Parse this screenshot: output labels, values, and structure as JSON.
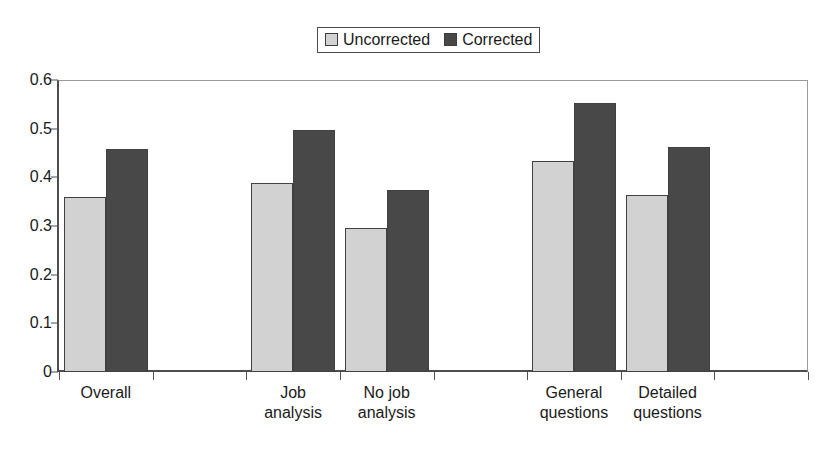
{
  "chart_data": {
    "type": "bar",
    "title": "",
    "subtitle": "",
    "xlabel": "",
    "ylabel": "",
    "ylim": [
      0,
      0.6
    ],
    "ytick_labels": [
      "0",
      "0.1",
      "0.2",
      "0.3",
      "0.4",
      "0.5",
      "0.6"
    ],
    "ytick_values": [
      0,
      0.1,
      0.2,
      0.3,
      0.4,
      0.5,
      0.6
    ],
    "grid": false,
    "legend_position": "top-center",
    "categories": [
      "Overall",
      "",
      "Job\nanalysis",
      "No job\nanalysis",
      "",
      "General\nquestions",
      "Detailed\nquestions",
      ""
    ],
    "series": [
      {
        "name": "Uncorrected",
        "color": "#d2d2d2",
        "values": [
          0.36,
          null,
          0.388,
          0.296,
          null,
          0.433,
          0.363,
          null
        ]
      },
      {
        "name": "Corrected",
        "color": "#484848",
        "values": [
          0.458,
          null,
          0.498,
          0.375,
          null,
          0.553,
          0.462,
          null
        ]
      }
    ],
    "annotations": []
  },
  "legend": {
    "entries": [
      {
        "label": "Uncorrected",
        "color": "#d2d2d2"
      },
      {
        "label": "Corrected",
        "color": "#484848"
      }
    ]
  },
  "axis": {
    "y_ticks": [
      "0.6",
      "0.5",
      "0.4",
      "0.3",
      "0.2",
      "0.1",
      "0"
    ],
    "x_labels": [
      "Overall",
      "Job\nanalysis",
      "No job\nanalysis",
      "General\nquestions",
      "Detailed\nquestions"
    ]
  },
  "colors": {
    "uncorrected": "#d2d2d2",
    "corrected": "#484848",
    "axis": "#4d4d4d",
    "text": "#1a1a1a",
    "background": "#ffffff"
  }
}
